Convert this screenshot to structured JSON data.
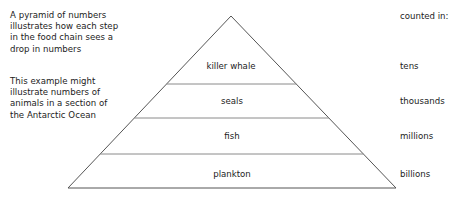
{
  "diagram": {
    "title": "pyramid of numbers",
    "notes": [
      {
        "id": "note-1",
        "text": "A pyramid of numbers\nillustrates how each step\nin the food chain sees a\ndrop in numbers"
      },
      {
        "id": "note-2",
        "text": "This example might\nillustrate numbers of\nanimals in a section of\nthe Antarctic Ocean"
      }
    ],
    "right_column": {
      "heading": "counted in:",
      "values": [
        "tens",
        "thousands",
        "millions",
        "billions"
      ]
    },
    "tiers": [
      {
        "label": "killer whale",
        "count": "tens",
        "level": 1
      },
      {
        "label": "seals",
        "count": "thousands",
        "level": 2
      },
      {
        "label": "fish",
        "count": "millions",
        "level": 3
      },
      {
        "label": "plankton",
        "count": "billions",
        "level": 4
      }
    ],
    "colors": {
      "outline": "#555555",
      "divider": "#8a8a8a",
      "text": "#1c1c1c",
      "background": "#ffffff"
    },
    "geometry": {
      "apex_x": 231,
      "apex_y": 16,
      "base_left_x": 68,
      "base_right_x": 396,
      "base_y": 188,
      "dividers_y": [
        84,
        118,
        154
      ],
      "tier_label_y": [
        66,
        101,
        136,
        174
      ]
    }
  }
}
